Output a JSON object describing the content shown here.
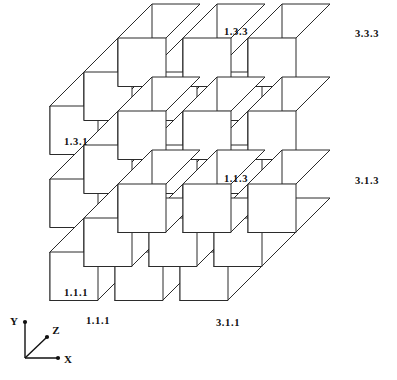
{
  "figure": {
    "type": "exploded-cube-lattice",
    "projection": "oblique",
    "dimensions": {
      "width": 397,
      "height": 380
    },
    "grid": {
      "nx": 3,
      "ny": 3,
      "nz": 3
    },
    "background_color": "#ffffff",
    "line_color": "#2b2b2b",
    "text_color": "#101010"
  },
  "geometry": {
    "cube_size": 48,
    "depth_dx": 34,
    "depth_dy": -34,
    "gap_x": 65,
    "gap_y": 73,
    "origin_x": 50,
    "origin_y": 300
  },
  "labels": [
    {
      "id": "label-1-3-3",
      "text": "1.3.3",
      "face": "front",
      "cell": [
        1,
        3,
        3
      ],
      "x": 236,
      "y": 33
    },
    {
      "id": "label-3-3-3",
      "text": "3.3.3",
      "face": "front",
      "cell": [
        3,
        3,
        3
      ],
      "x": 367,
      "y": 35
    },
    {
      "id": "label-1-3-1",
      "text": "1.3.1",
      "face": "left",
      "cell": [
        1,
        3,
        1
      ],
      "x": 76,
      "y": 143
    },
    {
      "id": "label-1-1-3",
      "text": "1.1.3",
      "face": "front",
      "cell": [
        1,
        1,
        3
      ],
      "x": 236,
      "y": 180
    },
    {
      "id": "label-3-1-3",
      "text": "3.1.3",
      "face": "front",
      "cell": [
        3,
        1,
        3
      ],
      "x": 367,
      "y": 182
    },
    {
      "id": "label-1-1-1-left",
      "text": "1.1.1",
      "face": "left",
      "cell": [
        1,
        1,
        1
      ],
      "x": 76,
      "y": 294
    },
    {
      "id": "label-1-1-1-bottom",
      "text": "1.1.1",
      "face": "bottom",
      "cell": [
        1,
        1,
        1
      ],
      "x": 98,
      "y": 322
    },
    {
      "id": "label-3-1-1-bottom",
      "text": "3.1.1",
      "face": "bottom",
      "cell": [
        3,
        1,
        1
      ],
      "x": 228,
      "y": 324
    }
  ],
  "axes": {
    "origin": {
      "x": 25,
      "y": 358
    },
    "items": [
      {
        "id": "axis-y",
        "label": "Y",
        "tip_x": 25,
        "tip_y": 322,
        "label_x": 14,
        "label_y": 322
      },
      {
        "id": "axis-z",
        "label": "Z",
        "tip_x": 47,
        "tip_y": 337,
        "label_x": 56,
        "label_y": 331
      },
      {
        "id": "axis-x",
        "label": "X",
        "tip_x": 58,
        "tip_y": 358,
        "label_x": 68,
        "label_y": 360
      }
    ]
  }
}
